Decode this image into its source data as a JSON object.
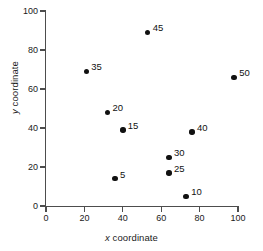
{
  "chart_data": {
    "type": "scatter",
    "title": "",
    "xlabel": "x coordinate",
    "ylabel": "y coordinate",
    "xlabel_italic_prefix": "x",
    "xlabel_rest": " coordinate",
    "ylabel_italic_prefix": "y",
    "ylabel_rest": " coordinate",
    "xlim": [
      0,
      100
    ],
    "ylim": [
      0,
      100
    ],
    "xticks": [
      0,
      20,
      40,
      60,
      80,
      100
    ],
    "yticks": [
      0,
      20,
      40,
      60,
      80,
      100
    ],
    "grid": false,
    "legend": "none",
    "marker_color": "#111111",
    "axis_color": "#4d4d4d",
    "background_color": "#ffffff",
    "points": [
      {
        "label": "45",
        "x": 53,
        "y": 89,
        "label_dx": 5,
        "label_dy": -9
      },
      {
        "label": "35",
        "x": 21,
        "y": 69,
        "label_dx": 5,
        "label_dy": -9
      },
      {
        "label": "50",
        "x": 98,
        "y": 66,
        "label_dx": 5,
        "label_dy": -9
      },
      {
        "label": "20",
        "x": 32,
        "y": 48,
        "label_dx": 5,
        "label_dy": -9
      },
      {
        "label": "15",
        "x": 40,
        "y": 39,
        "label_dx": 5,
        "label_dy": -9
      },
      {
        "label": "40",
        "x": 76,
        "y": 38,
        "label_dx": 5,
        "label_dy": -9
      },
      {
        "label": "30",
        "x": 64,
        "y": 25,
        "label_dx": 5,
        "label_dy": -9
      },
      {
        "label": "25",
        "x": 64,
        "y": 17,
        "label_dx": 5,
        "label_dy": -9
      },
      {
        "label": "5",
        "x": 36,
        "y": 14,
        "label_dx": 5,
        "label_dy": -9
      },
      {
        "label": "10",
        "x": 73,
        "y": 5,
        "label_dx": 5,
        "label_dy": -9
      }
    ]
  },
  "caption": {
    "text": ""
  }
}
